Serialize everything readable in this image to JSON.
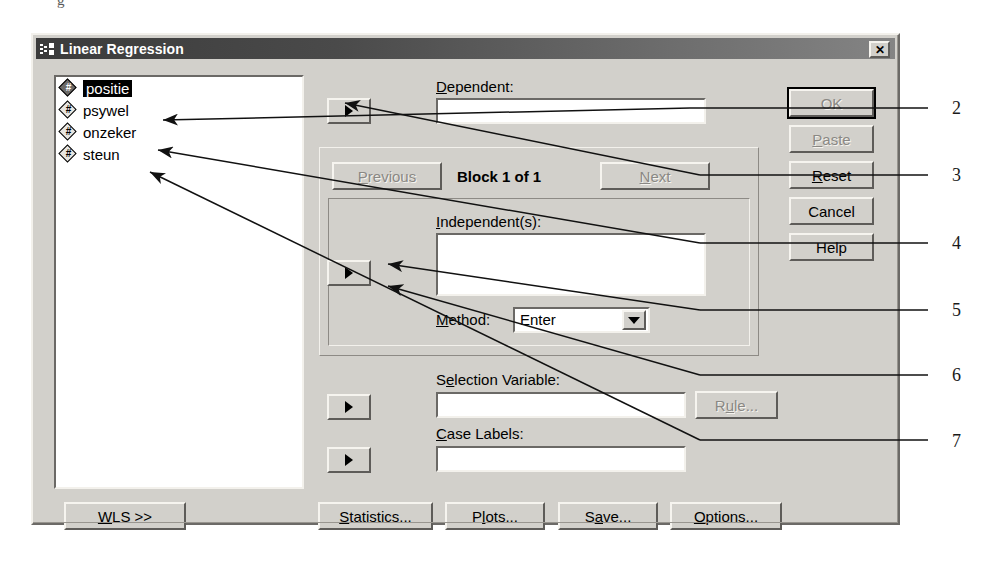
{
  "window": {
    "title": "Linear Regression",
    "icon": "spss-variable-icon",
    "close_label": "✕"
  },
  "variable_list": {
    "name": "source-variable-list",
    "items": [
      {
        "label": "positie",
        "icon": "numeric-variable-icon",
        "selected": true
      },
      {
        "label": "psywel",
        "icon": "numeric-variable-icon",
        "selected": false
      },
      {
        "label": "onzeker",
        "icon": "numeric-variable-icon",
        "selected": false
      },
      {
        "label": "steun",
        "icon": "numeric-variable-icon",
        "selected": false
      }
    ],
    "icon_glyph": "#"
  },
  "dependent": {
    "label_pre": "",
    "label_accel": "D",
    "label_post": "ependent:",
    "value": "",
    "move_button_glyph": "▶"
  },
  "block": {
    "previous_label": "Previous",
    "previous_accel": "P",
    "previous_rest": "revious",
    "previous_enabled": false,
    "text": "Block 1 of 1",
    "next_accel": "N",
    "next_rest": "ext",
    "next_label": "Next",
    "next_enabled": false
  },
  "independents": {
    "label_accel": "I",
    "label_post": "ndependent(s):",
    "value": "",
    "move_button_glyph": "▶"
  },
  "method": {
    "label_accel": "M",
    "label_post": "ethod:",
    "selected": "Enter",
    "options": [
      "Enter"
    ]
  },
  "selection_variable": {
    "label_pre": "S",
    "label_accel": "e",
    "label_post": "lection Variable:",
    "value": "",
    "move_button_glyph": "▶",
    "rule_label": "Rule...",
    "rule_accel": "u",
    "rule_enabled": false
  },
  "case_labels": {
    "label_accel": "C",
    "label_post": "ase Labels:",
    "value": "",
    "move_button_glyph": "▶"
  },
  "right_buttons": [
    {
      "label": "OK",
      "accel": "",
      "enabled": false,
      "default": true
    },
    {
      "label": "Paste",
      "accel": "P",
      "enabled": false,
      "default": false
    },
    {
      "label": "Reset",
      "accel": "R",
      "enabled": true,
      "default": false
    },
    {
      "label": "Cancel",
      "accel": "",
      "enabled": true,
      "default": false
    },
    {
      "label": "Help",
      "accel": "",
      "enabled": true,
      "default": false
    }
  ],
  "bottom_buttons": [
    {
      "label": "WLS >>",
      "accel": "W"
    },
    {
      "label": "Statistics...",
      "accel": "S"
    },
    {
      "label": "Plots...",
      "accel": "l"
    },
    {
      "label": "Save...",
      "accel": "a"
    },
    {
      "label": "Options...",
      "accel": "O"
    }
  ],
  "annotations": [
    {
      "number": "2",
      "x": 952,
      "y": 98
    },
    {
      "number": "3",
      "x": 952,
      "y": 165
    },
    {
      "number": "4",
      "x": 952,
      "y": 233
    },
    {
      "number": "5",
      "x": 952,
      "y": 300
    },
    {
      "number": "6",
      "x": 952,
      "y": 365
    },
    {
      "number": "7",
      "x": 952,
      "y": 432
    }
  ],
  "colors": {
    "dialog_face": "#d2d0cb",
    "titlebar_dark": "#3b3b3b",
    "field_bg": "#ffffff",
    "disabled_text": "#8a8884",
    "text": "#000000"
  }
}
